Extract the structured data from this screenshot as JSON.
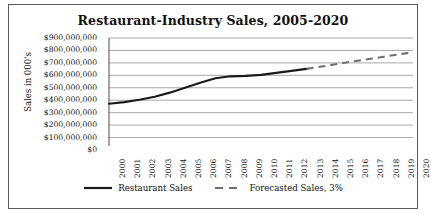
{
  "chart_data": {
    "type": "line",
    "title": "Restaurant-Industry Sales, 2005-2020",
    "xlabel": "",
    "ylabel": "Sales in 000's",
    "grid": true,
    "legend_position": "bottom",
    "ylim": [
      0,
      900000000
    ],
    "ytick_step": 100000000,
    "ytick_labels": [
      "$900,000,000",
      "$800,000,000",
      "$700,000,000",
      "$600,000,000",
      "$500,000,000",
      "$400,000,000",
      "$300,000,000",
      "$200,000,000",
      "$100,000,000",
      "$0"
    ],
    "ytick_values": [
      900000000,
      800000000,
      700000000,
      600000000,
      500000000,
      400000000,
      300000000,
      200000000,
      100000000,
      0
    ],
    "categories": [
      "2000",
      "2001",
      "2002",
      "2003",
      "2004",
      "2005",
      "2006",
      "2007",
      "2008",
      "2009",
      "2010",
      "2011",
      "2012",
      "2013",
      "2014",
      "2015",
      "2016",
      "2017",
      "2018",
      "2019",
      "2020"
    ],
    "series": [
      {
        "name": "Restaurant Sales",
        "style": "solid",
        "color": "#1a1a1a",
        "x": [
          "2000",
          "2001",
          "2002",
          "2003",
          "2004",
          "2005",
          "2006",
          "2007",
          "2008",
          "2009",
          "2010",
          "2011",
          "2012",
          "2013"
        ],
        "values": [
          372000000,
          385000000,
          404000000,
          428000000,
          461000000,
          500000000,
          540000000,
          576000000,
          592000000,
          596000000,
          604000000,
          620000000,
          636000000,
          652000000
        ]
      },
      {
        "name": "Forecasted Sales, 3%",
        "style": "dashed",
        "color": "#6e6e6e",
        "x": [
          "2013",
          "2014",
          "2015",
          "2016",
          "2017",
          "2018",
          "2019",
          "2020"
        ],
        "values": [
          652000000,
          671000000,
          691000000,
          711000000,
          729000000,
          748000000,
          767000000,
          786000000
        ]
      }
    ]
  },
  "legend": {
    "items": [
      {
        "label": "Restaurant Sales",
        "style": "solid",
        "color": "#1a1a1a"
      },
      {
        "label": "Forecasted Sales, 3%",
        "style": "dashed",
        "color": "#6e6e6e"
      }
    ]
  }
}
